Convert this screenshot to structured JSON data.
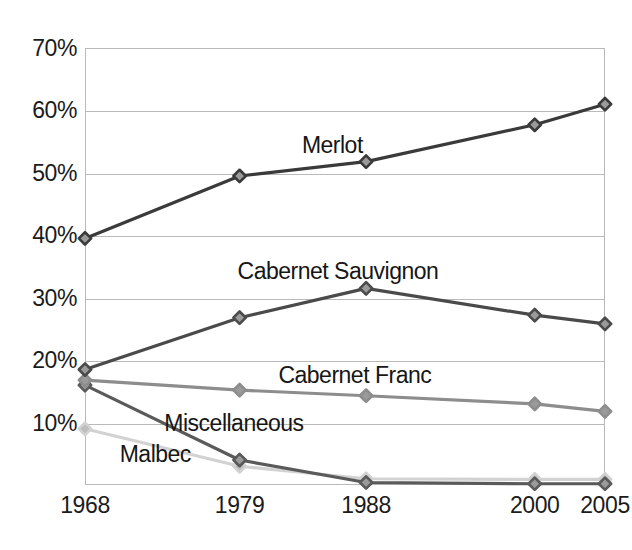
{
  "chart_data": {
    "type": "line",
    "title": "",
    "xlabel": "",
    "ylabel": "",
    "x": [
      1968,
      1979,
      1988,
      2000,
      2005
    ],
    "x_tick_labels": [
      "1968",
      "1979",
      "1988",
      "2000",
      "2005"
    ],
    "y_tick_labels": [
      "10%",
      "20%",
      "30%",
      "40%",
      "50%",
      "60%",
      "70%"
    ],
    "y_tick_values": [
      10,
      20,
      30,
      40,
      50,
      60,
      70
    ],
    "ylim": [
      0,
      70
    ],
    "xlim": [
      1968,
      2005
    ],
    "grid": true,
    "legend": "inline-labels",
    "series": [
      {
        "name": "Merlot",
        "color": "#3a3a3a",
        "values": [
          39.5,
          49.5,
          51.8,
          57.7,
          61.0
        ],
        "label_x": 1985.6,
        "label_y": 54.5
      },
      {
        "name": "Cabernet Sauvignon",
        "color": "#4a4a4a",
        "values": [
          18.5,
          26.8,
          31.5,
          27.2,
          25.8
        ],
        "label_x": 1986.0,
        "label_y": 34.2
      },
      {
        "name": "Cabernet Franc",
        "color": "#8d8d8d",
        "values": [
          16.8,
          15.2,
          14.3,
          13.0,
          11.8
        ],
        "label_x": 1987.2,
        "label_y": 17.6
      },
      {
        "name": "Miscellaneous",
        "color": "#5a5a5a",
        "values": [
          16.0,
          4.0,
          0.4,
          0.2,
          0.2
        ],
        "label_x": 1978.6,
        "label_y": 9.9
      },
      {
        "name": "Malbec",
        "color": "#d2d2d2",
        "values": [
          9.0,
          3.0,
          1.0,
          0.9,
          0.9
        ],
        "label_x": 1973.0,
        "label_y": 5.0
      }
    ]
  }
}
